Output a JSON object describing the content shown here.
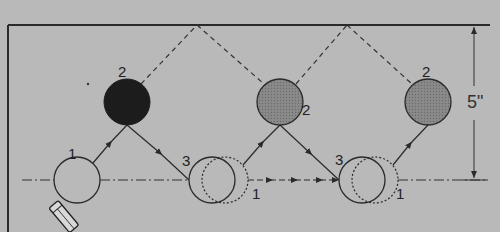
{
  "diagram": {
    "title": "",
    "colors": {
      "background": "#b9b9b9",
      "line": "#2a2a2a",
      "dark_ball": "#1c1c1c",
      "gray_ball": "#7d7d7d"
    },
    "labels": {
      "pos1_a": "1",
      "pos2_dark": "2",
      "pos3_a": "3",
      "pos1_b": "1",
      "pos2_mid": "2",
      "pos3_b": "3",
      "pos1_c": "1",
      "pos2_right": "2",
      "dimension": "5\""
    },
    "dimension": {
      "value": "5\"",
      "from": "upper boundary",
      "to": "center line"
    }
  }
}
